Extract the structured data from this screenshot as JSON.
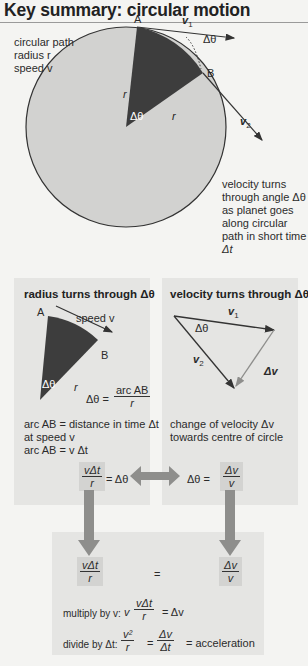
{
  "title": "Key summary: circular motion",
  "top_diagram": {
    "left_labels": [
      "circular path",
      "radius r",
      "speed v"
    ],
    "point_a": "A",
    "point_b": "B",
    "v1": "v",
    "v1_sub": "1",
    "v2": "v",
    "v2_sub": "2",
    "delta_theta": "Δθ",
    "r": "r",
    "right_labels": [
      "velocity turns",
      "through angle Δθ",
      "as planet goes",
      "along circular",
      "path in short time",
      "Δt"
    ]
  },
  "left_panel": {
    "title": "radius turns through Δθ",
    "point_a": "A",
    "point_b": "B",
    "speed_label": "speed v",
    "delta_theta": "Δθ",
    "r": "r",
    "formula_lhs": "Δθ =",
    "formula_num": "arc AB",
    "formula_den": "r",
    "notes": [
      "arc AB = distance in time Δt",
      "at speed v",
      "arc AB = v Δt"
    ]
  },
  "right_panel": {
    "title": "velocity turns through Δθ",
    "v1": "v",
    "v1_sub": "1",
    "v2": "v",
    "v2_sub": "2",
    "delta_theta": "Δθ",
    "delta_v": "Δv",
    "notes": [
      "change of velocity Δv",
      "towards centre of circle"
    ]
  },
  "equations": {
    "left_num": "vΔt",
    "left_den": "r",
    "left_eq": "= Δθ",
    "right_lhs": "Δθ =",
    "right_num": "Δv",
    "right_den": "v",
    "equals": "=",
    "result_left_num": "vΔt",
    "result_left_den": "r",
    "result_right_num": "Δv",
    "result_right_den": "v",
    "multiply_label": "multiply by v:",
    "multiply_prefix": "v",
    "multiply_num": "vΔt",
    "multiply_den": "r",
    "multiply_rhs": "= Δv",
    "divide_label": "divide by Δt:",
    "divide_num": "v²",
    "divide_den": "r",
    "divide_eq": "=",
    "divide_num2": "Δv",
    "divide_den2": "Δt",
    "divide_rhs": "= acceleration"
  },
  "colors": {
    "circle_fill": "#d2d2d0",
    "sector_fill": "#3d3d3d",
    "panel_bg": "#e5e5e3",
    "arrow_grey": "#8e8e8c",
    "background": "#f4f4f2"
  }
}
